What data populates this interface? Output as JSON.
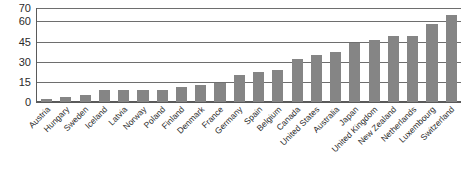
{
  "chart_data": {
    "type": "bar",
    "title": "",
    "subtitle": "",
    "xlabel": "",
    "ylabel": "",
    "ylim": [
      0,
      70
    ],
    "yticks": [
      0,
      15,
      30,
      45,
      60,
      70
    ],
    "ytick_labels": [
      "0",
      "15",
      "30",
      "45",
      "60",
      "70"
    ],
    "grid": true,
    "legend": "none",
    "orientation": "vertical",
    "bar_color": "#858585",
    "axis_color": "#5a5a5a",
    "gridline_color": "#6e6e6e",
    "background_color": "#ffffff",
    "xtick_rotation": -45,
    "categories": [
      "Austria",
      "Hungary",
      "Sweden",
      "Iceland",
      "Latvia",
      "Norway",
      "Poland",
      "Finland",
      "Denmark",
      "France",
      "Germany",
      "Spain",
      "Belgium",
      "Canada",
      "United States",
      "Australia",
      "Japan",
      "United Kingdom",
      "New Zealand",
      "Netherlands",
      "Luxembourg",
      "Switzerland"
    ],
    "values": [
      2,
      4,
      5,
      9,
      9,
      9,
      9,
      11,
      13,
      14,
      20,
      22,
      24,
      32,
      35,
      37,
      44,
      46,
      49,
      49,
      58,
      65
    ]
  }
}
